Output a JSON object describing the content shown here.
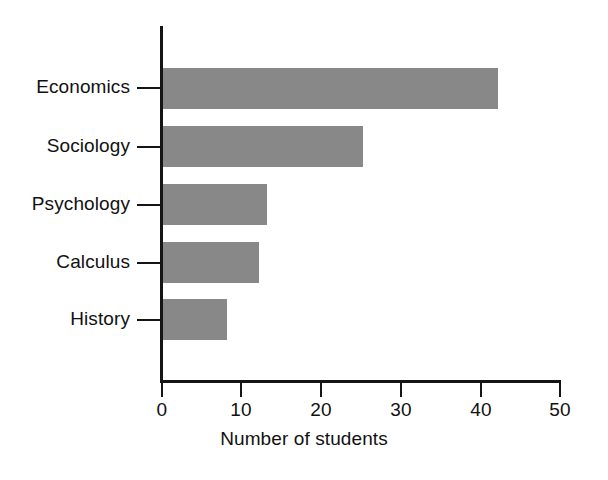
{
  "chart_data": {
    "type": "bar",
    "orientation": "horizontal",
    "title": "",
    "xlabel": "Number of students",
    "ylabel": "",
    "categories": [
      "Economics",
      "Sociology",
      "Psychology",
      "Calculus",
      "History"
    ],
    "values": [
      42,
      25,
      13,
      12,
      8
    ],
    "series": [
      {
        "name": "Number of students",
        "values": [
          42,
          25,
          13,
          12,
          8
        ]
      }
    ],
    "xlim": [
      0,
      50
    ],
    "xticks": [
      0,
      10,
      20,
      30,
      40,
      50
    ],
    "xtick_labels": [
      "0",
      "10",
      "20",
      "30",
      "40",
      "50"
    ],
    "grid": false,
    "legend": false,
    "legend_position": "none",
    "bar_color": "#888888",
    "axis_color": "#151515",
    "background_color": "#ffffff"
  }
}
